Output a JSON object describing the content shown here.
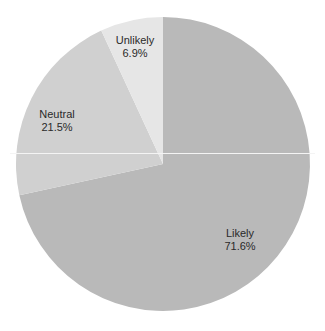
{
  "chart_data": {
    "type": "pie",
    "title": "",
    "start_angle_deg": 0,
    "direction": "clockwise",
    "categories": [
      "Likely",
      "Neutral",
      "Unlikely"
    ],
    "values": [
      71.6,
      21.5,
      6.9
    ],
    "unit": "%",
    "labels": [
      {
        "name": "Likely",
        "value_text": "71.6%"
      },
      {
        "name": "Neutral",
        "value_text": "21.5%"
      },
      {
        "name": "Unlikely",
        "value_text": "6.9%"
      }
    ],
    "colors": [
      "#b9b9b9",
      "#d0d0d0",
      "#e6e6e6"
    ],
    "legend": "none (labels inside slices)"
  },
  "geometry": {
    "cx": 163,
    "cy": 164,
    "r": 147
  },
  "label_positions": [
    {
      "x": 240,
      "y": 240
    },
    {
      "x": 57,
      "y": 121
    },
    {
      "x": 135,
      "y": 47
    }
  ]
}
